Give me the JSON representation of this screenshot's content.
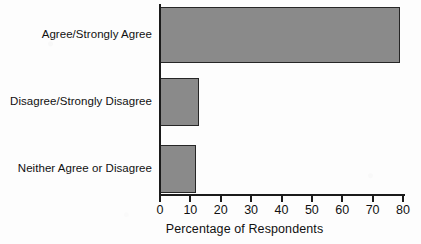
{
  "chart_data": {
    "type": "bar",
    "orientation": "horizontal",
    "title": "",
    "subtitle": "",
    "categories": [
      "Agree/Strongly Agree",
      "Disagree/Strongly Disagree",
      "Neither Agree or Disagree"
    ],
    "values": [
      79,
      13,
      12
    ],
    "xlabel": "Percentage of Respondents",
    "ylabel": "",
    "xlim": [
      0,
      80
    ],
    "xticks": [
      0,
      10,
      20,
      30,
      40,
      50,
      60,
      70,
      80
    ],
    "xtick_labels": [
      "0",
      "10",
      "20",
      "30",
      "40",
      "50",
      "60",
      "70",
      "80"
    ],
    "grid": false,
    "legend": false,
    "legend_position": "none",
    "bar_fill_color": "#8a8a8a",
    "bar_edge_color": "#262626",
    "axis_color": "#1b1b1b",
    "background_color": "#fdfdfd"
  }
}
